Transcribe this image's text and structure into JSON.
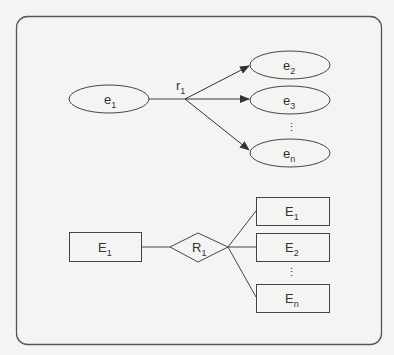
{
  "diagram": {
    "top": {
      "source": {
        "label": "e",
        "sub": "1"
      },
      "relation": {
        "label": "r",
        "sub": "1"
      },
      "targets": [
        {
          "label": "e",
          "sub": "2"
        },
        {
          "label": "e",
          "sub": "3"
        },
        {
          "label": "e",
          "sub": "n"
        }
      ],
      "ellipsis": "⋮"
    },
    "bottom": {
      "source": {
        "label": "E",
        "sub": "1"
      },
      "relation": {
        "label": "R",
        "sub": "1"
      },
      "targets": [
        {
          "label": "E",
          "sub": "1"
        },
        {
          "label": "E",
          "sub": "2"
        },
        {
          "label": "E",
          "sub": "n"
        }
      ],
      "ellipsis": "⋮"
    }
  },
  "colors": {
    "stroke": "#444444",
    "background": "#f4f4f2",
    "text": "#333333"
  }
}
